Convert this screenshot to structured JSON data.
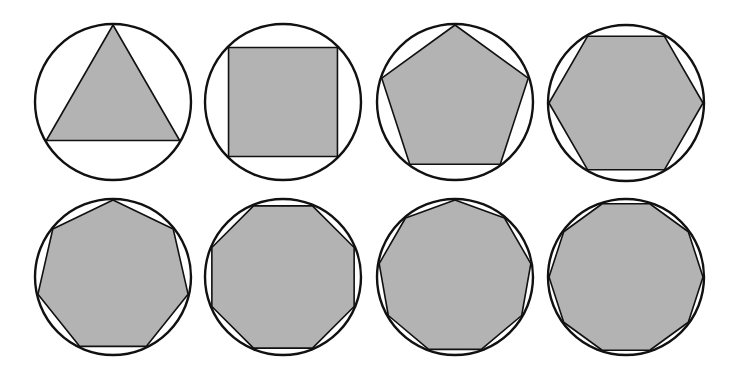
{
  "figure": {
    "fill_color": "#b3b3b3",
    "stroke_color": "#111111",
    "background": "#ffffff",
    "shapes": [
      {
        "sides": 3,
        "name": "triangle",
        "cx": 113,
        "cy": 102,
        "r": 78,
        "rotation_deg": -90
      },
      {
        "sides": 4,
        "name": "square",
        "cx": 283,
        "cy": 102,
        "r": 78,
        "rotation_deg": -45
      },
      {
        "sides": 5,
        "name": "pentagon",
        "cx": 455,
        "cy": 102,
        "r": 78,
        "rotation_deg": -90
      },
      {
        "sides": 6,
        "name": "hexagon",
        "cx": 626,
        "cy": 103,
        "r": 78,
        "rotation_deg": 0
      },
      {
        "sides": 7,
        "name": "heptagon",
        "cx": 113,
        "cy": 277,
        "r": 78,
        "rotation_deg": -90
      },
      {
        "sides": 8,
        "name": "octagon",
        "cx": 283,
        "cy": 277,
        "r": 78,
        "rotation_deg": -22.5
      },
      {
        "sides": 9,
        "name": "nonagon",
        "cx": 455,
        "cy": 277,
        "r": 78,
        "rotation_deg": -90
      },
      {
        "sides": 10,
        "name": "decagon",
        "cx": 626,
        "cy": 277,
        "r": 78,
        "rotation_deg": 0
      }
    ]
  }
}
